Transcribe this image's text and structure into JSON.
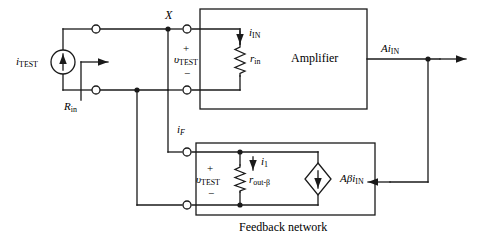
{
  "diagram": {
    "colors": {
      "wire": "#1a1a1a",
      "background": "#ffffff",
      "text": "#000000"
    },
    "blocks": [
      {
        "id": "amplifier",
        "label": "Amplifier"
      },
      {
        "id": "feedback",
        "label": "Feedback network"
      }
    ],
    "sources": [
      {
        "id": "itest",
        "label_main": "i",
        "label_sub": "TEST",
        "type": "independent-current-source",
        "symbol": "circle",
        "arrow": "up"
      },
      {
        "id": "dependent",
        "label_main": "Aβi",
        "label_sub": "IN",
        "type": "dependent-current-source",
        "symbol": "diamond",
        "arrow": "down"
      }
    ],
    "resistors": [
      {
        "id": "rin-amp",
        "label_main": "r",
        "label_sub": "in"
      },
      {
        "id": "rout-beta",
        "label_main": "r",
        "label_sub": "out-β"
      }
    ],
    "currents": [
      {
        "id": "i-in",
        "label_main": "i",
        "label_sub": "IN",
        "direction": "down"
      },
      {
        "id": "i-f",
        "label_main": "i",
        "label_sub": "F",
        "direction": "down"
      },
      {
        "id": "i-1",
        "label_main": "i",
        "label_sub": "1",
        "direction": "down"
      },
      {
        "id": "a-i-in",
        "label_main": "Ai",
        "label_sub": "IN",
        "direction": "right"
      }
    ],
    "voltages": [
      {
        "id": "vtest-top",
        "label_main": "υ",
        "label_sub": "TEST",
        "plus": "+",
        "minus": "−"
      },
      {
        "id": "vtest-bottom",
        "label_main": "υ",
        "label_sub": "TEST",
        "plus": "+",
        "minus": "−"
      }
    ],
    "nodes": [
      {
        "id": "node-x",
        "label": "X"
      }
    ],
    "parameters": [
      {
        "id": "r-in-total",
        "label_main": "R",
        "label_sub": "in"
      }
    ]
  }
}
